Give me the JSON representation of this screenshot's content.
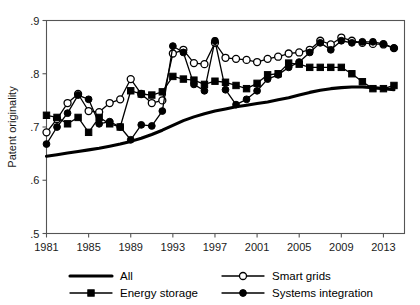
{
  "chart_data": {
    "type": "line",
    "title": "",
    "xlabel": "",
    "ylabel": "Patent originality",
    "xlim": [
      1981,
      2015
    ],
    "ylim": [
      0.5,
      0.9
    ],
    "grid": false,
    "legend_position": "bottom",
    "xticks": [
      1981,
      1985,
      1989,
      1993,
      1997,
      2001,
      2005,
      2009,
      2013
    ],
    "xtick_labels": [
      "1981",
      "1985",
      "1989",
      "1993",
      "1997",
      "2001",
      "2005",
      "2009",
      "2013"
    ],
    "yticks": [
      0.5,
      0.6,
      0.7,
      0.8,
      0.9
    ],
    "ytick_labels": [
      ".5",
      ".6",
      ".7",
      ".8",
      ".9"
    ],
    "x": [
      1981,
      1982,
      1983,
      1984,
      1985,
      1986,
      1987,
      1988,
      1989,
      1990,
      1991,
      1992,
      1993,
      1994,
      1995,
      1996,
      1997,
      1998,
      1999,
      2000,
      2001,
      2002,
      2003,
      2004,
      2005,
      2006,
      2007,
      2008,
      2009,
      2010,
      2011,
      2012,
      2013,
      2014
    ],
    "series": [
      {
        "name": "All",
        "marker": "none",
        "line": "thick-solid",
        "values": [
          0.645,
          0.648,
          0.651,
          0.654,
          0.657,
          0.66,
          0.664,
          0.668,
          0.673,
          0.679,
          0.686,
          0.694,
          0.703,
          0.712,
          0.719,
          0.725,
          0.73,
          0.734,
          0.738,
          0.741,
          0.744,
          0.747,
          0.751,
          0.755,
          0.76,
          0.765,
          0.769,
          0.772,
          0.774,
          0.775,
          0.775,
          0.774,
          0.772,
          0.77
        ]
      },
      {
        "name": "Smart grids",
        "marker": "open-circle",
        "line": "thin-solid",
        "values": [
          0.69,
          0.715,
          0.745,
          0.762,
          0.73,
          0.728,
          0.745,
          0.752,
          0.79,
          0.762,
          0.745,
          0.75,
          0.838,
          0.845,
          0.82,
          0.818,
          0.858,
          0.83,
          0.828,
          0.826,
          0.822,
          0.828,
          0.832,
          0.838,
          0.84,
          0.845,
          0.862,
          0.855,
          0.868,
          0.862,
          0.858,
          0.856,
          0.855,
          0.848
        ]
      },
      {
        "name": "Energy storage",
        "marker": "filled-square",
        "line": "thin-solid",
        "values": [
          0.722,
          0.718,
          0.706,
          0.718,
          0.69,
          0.718,
          0.706,
          0.7,
          0.768,
          0.762,
          0.76,
          0.766,
          0.795,
          0.79,
          0.788,
          0.78,
          0.786,
          0.784,
          0.778,
          0.772,
          0.782,
          0.798,
          0.8,
          0.82,
          0.818,
          0.812,
          0.812,
          0.812,
          0.812,
          0.8,
          0.785,
          0.772,
          0.772,
          0.778
        ]
      },
      {
        "name": "Systems integration",
        "marker": "filled-circle",
        "line": "thin-solid",
        "values": [
          0.668,
          0.7,
          0.726,
          0.76,
          0.752,
          0.706,
          0.71,
          0.7,
          0.676,
          0.704,
          0.702,
          0.73,
          0.852,
          0.84,
          0.78,
          0.768,
          0.862,
          0.77,
          0.742,
          0.752,
          0.768,
          0.79,
          0.798,
          0.812,
          0.822,
          0.84,
          0.858,
          0.845,
          0.862,
          0.858,
          0.86,
          0.86,
          0.856,
          0.848
        ]
      }
    ]
  },
  "legend": {
    "entries": [
      {
        "label": "All",
        "marker": "none",
        "style": "thick-line"
      },
      {
        "label": "Smart grids",
        "marker": "open-circle",
        "style": "thin-line"
      },
      {
        "label": "Energy storage",
        "marker": "filled-square",
        "style": "thin-line"
      },
      {
        "label": "Systems integration",
        "marker": "filled-circle",
        "style": "thin-line"
      }
    ]
  }
}
